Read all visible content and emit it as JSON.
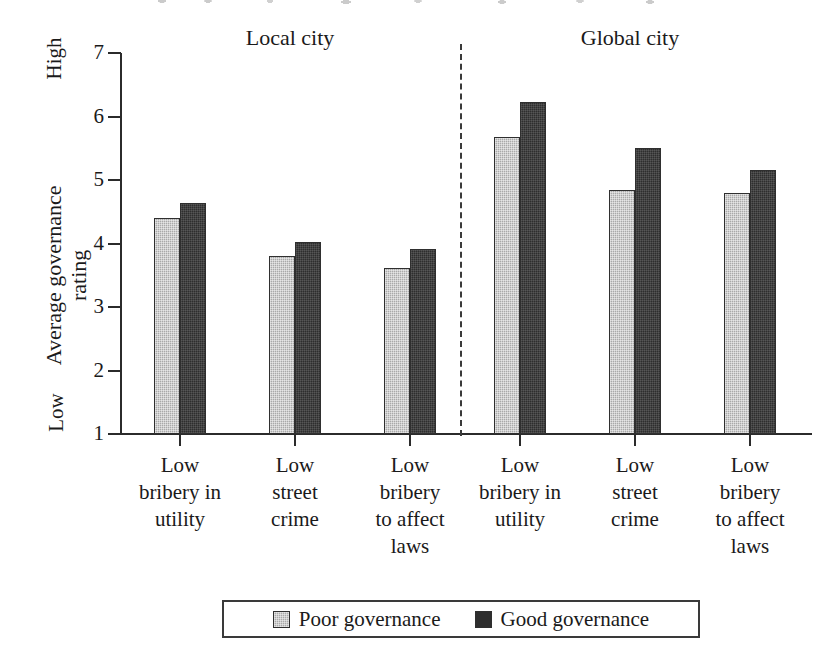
{
  "chart_data": {
    "type": "bar",
    "title": "",
    "xlabel": "",
    "ylabel": "Average governance\nrating",
    "ylim": [
      1,
      7
    ],
    "ytick_values": [
      7,
      6,
      5,
      4,
      3,
      2,
      1
    ],
    "ytick_labels": [
      "7",
      "6",
      "5",
      "4",
      "3",
      "2",
      "1"
    ],
    "y_axis_low_label": "Low",
    "y_axis_high_label": "High",
    "grid": false,
    "legend_position": "bottom-center",
    "panels": [
      {
        "name": "Local city",
        "label": "Local city"
      },
      {
        "name": "Global city",
        "label": "Global city"
      }
    ],
    "categories": [
      "Low bribery in utility",
      "Low street crime",
      "Low bribery to affect laws",
      "Low bribery in utility",
      "Low street crime",
      "Low bribery to affect laws"
    ],
    "category_labels_wrapped": [
      "Low\nbribery in\nutility",
      "Low\nstreet\ncrime",
      "Low\nbribery\nto affect\nlaws",
      "Low\nbribery in\nutility",
      "Low\nstreet\ncrime",
      "Low\nbribery\nto affect\nlaws"
    ],
    "series": [
      {
        "name": "Poor governance",
        "color": "#a9a9a9",
        "values": [
          4.4,
          3.81,
          3.61,
          5.67,
          4.85,
          4.8
        ]
      },
      {
        "name": "Good governance",
        "color": "#2e2e2e",
        "values": [
          4.63,
          4.02,
          3.92,
          6.23,
          5.5,
          5.15
        ]
      }
    ],
    "legend": [
      {
        "label": "Poor governance",
        "swatch": "poor"
      },
      {
        "label": "Good governance",
        "swatch": "good"
      }
    ],
    "divider": {
      "style": "dashed",
      "between": [
        "Local city",
        "Global city"
      ]
    }
  },
  "layout": {
    "group_centers_px": [
      180,
      295,
      410,
      520,
      635,
      750
    ],
    "axis_left_px": 120,
    "axis_baseline_px": 434,
    "axis_top_px": 53,
    "divider_x_px": 461,
    "bar_width_px": 26,
    "panel_header_centers_px": [
      290,
      630
    ]
  }
}
